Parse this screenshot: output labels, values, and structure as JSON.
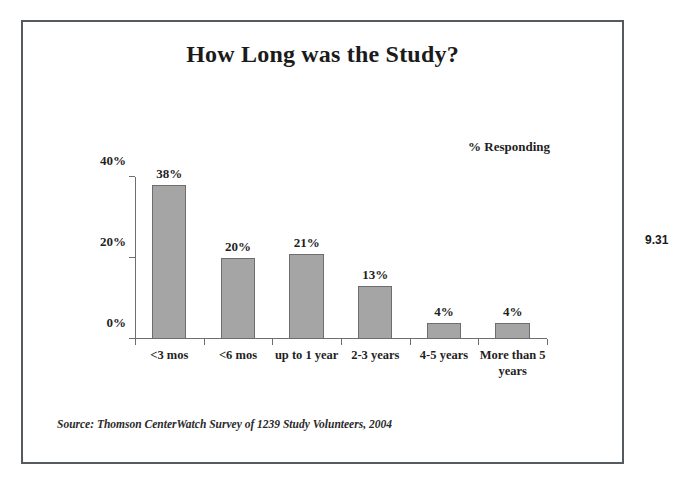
{
  "slide": {
    "title": "How Long was the Study?",
    "slide_number": "9.31",
    "source_note": "Source: Thomson CenterWatch Survey of 1239 Study Volunteers, 2004",
    "frame_color": "#555a5e"
  },
  "chart_data": {
    "type": "bar",
    "title": "How Long was the Study?",
    "categories": [
      "<3 mos",
      "<6 mos",
      "up to 1 year",
      "2-3 years",
      "4-5 years",
      "More than 5 years"
    ],
    "values": [
      38,
      20,
      21,
      13,
      4,
      4
    ],
    "value_labels": [
      "38%",
      "20%",
      "21%",
      "13%",
      "4%",
      "4%"
    ],
    "xlabel": "",
    "ylabel": "% Responding",
    "ylim": [
      0,
      40
    ],
    "yticks": [
      0,
      20,
      40
    ],
    "ytick_labels": [
      "0%",
      "20%",
      "40%"
    ],
    "grid": false,
    "legend": false,
    "bar_color": "#a5a5a5",
    "bar_border_color": "#6d6d6d",
    "axis_color": "#6e6e6e"
  }
}
